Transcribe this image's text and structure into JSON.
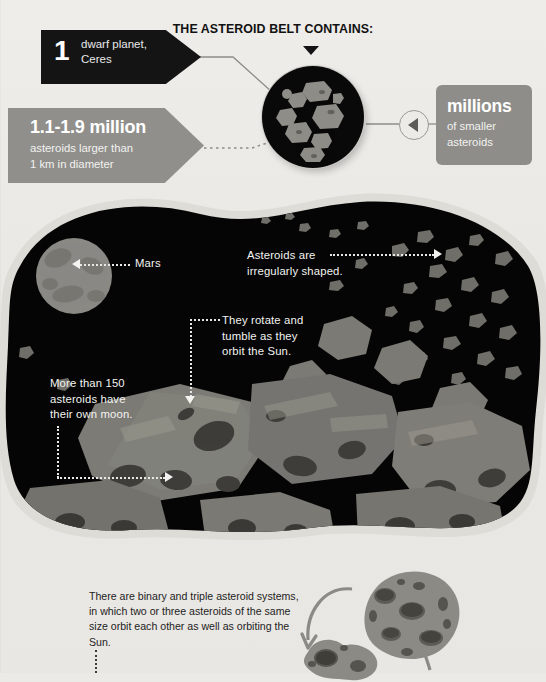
{
  "header": {
    "title": "THE ASTEROID BELT CONTAINS:",
    "caret_icon": "triangle-down-icon"
  },
  "callouts": {
    "dwarf_planet": {
      "number": "1",
      "line1": "dwarf planet,",
      "line2": "Ceres",
      "shape": "right-arrow-banner",
      "background": "#141414",
      "text_color": "#ffffff"
    },
    "asteroid_count": {
      "number": "1.1-1.9 million",
      "line1": "asteroids larger than",
      "line2": "1 km in diameter",
      "shape": "right-arrow-banner",
      "background": "#908f8b",
      "text_color": "#ffffff"
    },
    "smaller_asteroids": {
      "number": "millions",
      "line1": "of smaller",
      "line2": "asteroids",
      "shape": "rounded-box",
      "background": "#8e8d89",
      "text_color": "#ffffff"
    }
  },
  "connector_node": {
    "icon": "triangle-left-icon",
    "stroke": "#9a9995"
  },
  "disc": {
    "name": "asteroid-cluster-disc",
    "background": "#090909",
    "rock_color": "#8e8d87",
    "rock_count": 9
  },
  "panel": {
    "background": "#050505",
    "halo": "#dedcd7",
    "mars": {
      "label": "Mars",
      "color": "#8a8984"
    },
    "annotations": [
      {
        "id": "irregular-shape",
        "lines": [
          "Asteroids are",
          "irregularly shaped."
        ],
        "arrow": "arrow-right-icon"
      },
      {
        "id": "rotate-tumble",
        "lines": [
          "They rotate and",
          "tumble as they",
          "orbit the Sun."
        ],
        "arrow": "arrow-down-icon"
      },
      {
        "id": "own-moon",
        "lines": [
          "More than 150",
          "asteroids have",
          "their own moon."
        ],
        "arrow": "arrow-right-icon"
      }
    ]
  },
  "bottom": {
    "paragraph": "There are binary and triple asteroid systems, in which two or three asteroids of the same size orbit each other as well as orbiting the Sun.",
    "asteroid_large": "cratered-asteroid-icon",
    "asteroid_small": "binary-asteroid-icon",
    "orbit_arrow_left": "curved-arrow-down-icon",
    "orbit_arrow_right": "curved-arrow-up-icon"
  },
  "colors": {
    "page_background": "#eceae6",
    "dark": "#141414",
    "gray": "#8e8d89",
    "white_text": "#f3f3f1"
  }
}
